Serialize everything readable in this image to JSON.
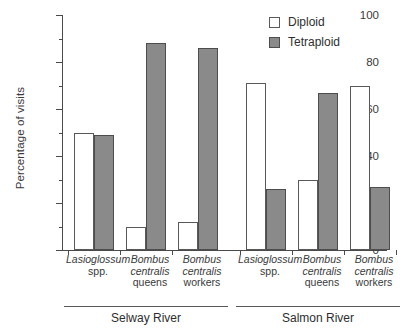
{
  "chart_data": {
    "type": "bar",
    "title": "",
    "xlabel": "",
    "ylabel": "Percentage of visits",
    "ylim": [
      0,
      100
    ],
    "ytick_labels": [
      "0",
      "20",
      "40",
      "60",
      "80",
      "100"
    ],
    "ytick_values": [
      0,
      20,
      40,
      60,
      80,
      100
    ],
    "minor_tick_values": [
      10,
      30,
      50,
      70,
      90
    ],
    "grid": false,
    "legend_position": "top-right",
    "categories": [
      "Lasioglossum spp.",
      "Bombus centralis queens",
      "Bombus centralis workers",
      "Lasioglossum spp.",
      "Bombus centralis queens",
      "Bombus centralis workers"
    ],
    "series": [
      {
        "name": "Diploid",
        "color": "#ffffff",
        "values": [
          50,
          10,
          12,
          71,
          30,
          70
        ]
      },
      {
        "name": "Tetraploid",
        "color": "#8a8a8a",
        "values": [
          49,
          88,
          86,
          26,
          67,
          27
        ]
      }
    ],
    "groups": [
      {
        "label": "Selway River",
        "categories": [
          0,
          1,
          2
        ]
      },
      {
        "label": "Salmon River",
        "categories": [
          3,
          4,
          5
        ]
      }
    ]
  },
  "axis": {
    "y_title": "Percentage of visits",
    "ticks": [
      {
        "label": "100",
        "value": 100
      },
      {
        "label": "80",
        "value": 80
      },
      {
        "label": "60",
        "value": 60
      },
      {
        "label": "40",
        "value": 40
      },
      {
        "label": "20",
        "value": 20
      },
      {
        "label": "0",
        "value": 0
      }
    ]
  },
  "legend": {
    "items": [
      {
        "label": "Diploid",
        "swatch": "open-square-swatch"
      },
      {
        "label": "Tetraploid",
        "swatch": "filled-square-swatch"
      }
    ]
  },
  "categories": [
    {
      "genus": "Lasioglossum",
      "species": "spp.",
      "caste": ""
    },
    {
      "genus": "Bombus",
      "species": "centralis",
      "caste": "queens"
    },
    {
      "genus": "Bombus",
      "species": "centralis",
      "caste": "workers"
    },
    {
      "genus": "Lasioglossum",
      "species": "spp.",
      "caste": ""
    },
    {
      "genus": "Bombus",
      "species": "centralis",
      "caste": "queens"
    },
    {
      "genus": "Bombus",
      "species": "centralis",
      "caste": "workers"
    }
  ],
  "groups": [
    {
      "label": "Selway River"
    },
    {
      "label": "Salmon River"
    }
  ],
  "colors": {
    "diploid_fill": "#ffffff",
    "tetraploid_fill": "#8a8a8a",
    "bar_outline": "#595959",
    "axis": "#4a4a4a",
    "text": "#2e2e2e"
  }
}
